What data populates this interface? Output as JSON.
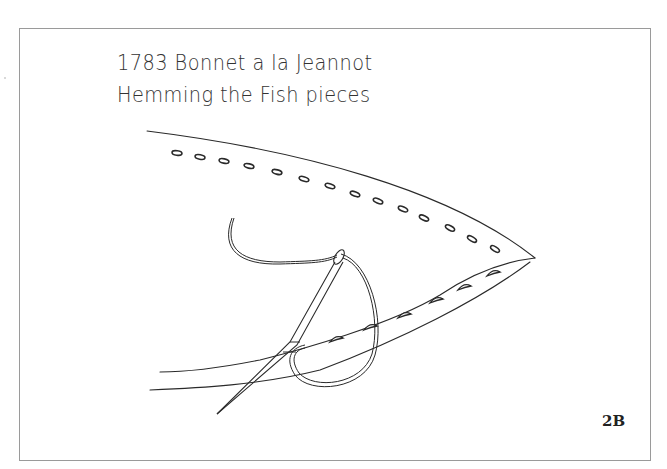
{
  "diagram": {
    "title_line_1": "1783 Bonnet a la Jeannot",
    "title_line_2": "Hemming the Fish pieces",
    "figure_label": "2B",
    "colors": {
      "line": "#2a2a2a",
      "frame": "#9a9a9a",
      "background": "#ffffff"
    },
    "elements": [
      "fabric-fish-piece",
      "running-stitch-holes",
      "hem-stitches",
      "needle",
      "thread"
    ]
  }
}
